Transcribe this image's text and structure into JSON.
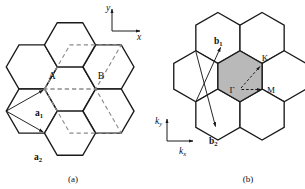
{
  "figure": {
    "background_color": "#ffffff",
    "line_color": "#1a1a1a",
    "dashed_cell_color": "#8c8c8c",
    "brillouin_zone_fill": "#b9b9b9"
  },
  "panel_a": {
    "caption": "(a)",
    "axes": {
      "x_label": "x",
      "y_label": "y"
    },
    "atoms": [
      {
        "label": "A"
      },
      {
        "label": "B"
      }
    ],
    "vectors": [
      {
        "name": "a1",
        "label": "a",
        "subscript": "1"
      },
      {
        "name": "a2",
        "label": "a",
        "subscript": "2"
      }
    ],
    "unit_cell": {
      "shape": "rhombus",
      "style": "dashed"
    },
    "hexagon_count": 7,
    "hexagon_orientation": "flat-top"
  },
  "panel_b": {
    "caption": "(b)",
    "axes": {
      "kx_label": "k",
      "kx_subscript": "x",
      "ky_label": "k",
      "ky_subscript": "y"
    },
    "vectors": [
      {
        "name": "b1",
        "label": "b",
        "subscript": "1"
      },
      {
        "name": "b2",
        "label": "b",
        "subscript": "2"
      }
    ],
    "symmetry_points": [
      {
        "label": "Γ",
        "name": "gamma"
      },
      {
        "label": "K",
        "name": "k-point"
      },
      {
        "label": "M",
        "name": "m-point"
      }
    ],
    "brillouin_zone": {
      "shaded": true,
      "fill": "#b9b9b9"
    },
    "hexagon_count": 7,
    "hexagon_orientation": "pointy-top"
  }
}
